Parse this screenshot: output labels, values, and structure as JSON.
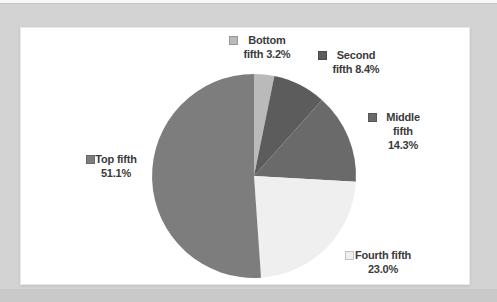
{
  "chart_data": {
    "type": "pie",
    "title": "",
    "categories": [
      "Bottom fifth",
      "Second fifth",
      "Middle fifth",
      "Fourth fifth",
      "Top fifth"
    ],
    "values": [
      3.2,
      8.4,
      14.3,
      23.0,
      51.1
    ],
    "unit": "%",
    "colors": [
      "#bababa",
      "#5c5c5c",
      "#6a6a6a",
      "#efefef",
      "#7d7d7d"
    ],
    "start_angle_deg": 0,
    "direction": "clockwise",
    "legend_position": "callout-labels-around-pie",
    "labels": {
      "bottom": {
        "line1": "Bottom",
        "line2": "fifth 3.2%"
      },
      "second": {
        "line1": "Second",
        "line2": "fifth 8.4%"
      },
      "middle": {
        "line1": "Middle",
        "line2": "fifth",
        "line3": "14.3%"
      },
      "top": {
        "line1": "Top fifth",
        "line2": "51.1%"
      },
      "fourth": {
        "line1": "Fourth fifth",
        "line2": "23.0%"
      }
    }
  }
}
